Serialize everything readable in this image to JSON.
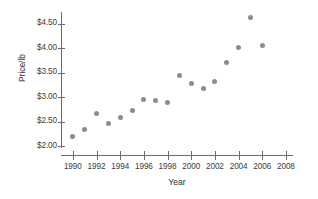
{
  "chart_data": {
    "type": "scatter",
    "title": "",
    "xlabel": "Year",
    "ylabel": "Price/lb",
    "xlim": [
      1989,
      2008.6
    ],
    "ylim": [
      1.82,
      4.74
    ],
    "grid": false,
    "legend": null,
    "x_ticks": [
      1990,
      1992,
      1994,
      1996,
      1998,
      2000,
      2002,
      2004,
      2006,
      2008
    ],
    "x_tick_labels": [
      "1990",
      "1992",
      "1994",
      "1996",
      "1998",
      "2000",
      "2002",
      "2004",
      "2006",
      "2008"
    ],
    "y_ticks": [
      2.0,
      2.5,
      3.0,
      3.5,
      4.0,
      4.5
    ],
    "y_tick_labels": [
      "$2.00",
      "$2.50",
      "$3.00",
      "$3.50",
      "$4.00",
      "$4.50"
    ],
    "x": [
      1990,
      1991,
      1992,
      1993,
      1994,
      1995,
      1996,
      1997,
      1998,
      1999,
      2000,
      2001,
      2002,
      2003,
      2004,
      2005,
      2006
    ],
    "values": [
      2.2,
      2.35,
      2.67,
      2.46,
      2.58,
      2.72,
      2.95,
      2.93,
      2.9,
      3.44,
      3.28,
      3.17,
      3.32,
      3.72,
      4.01,
      4.62,
      4.06
    ],
    "marker_color": "#8c8c8e",
    "axis_color": "#6b6b6b"
  }
}
